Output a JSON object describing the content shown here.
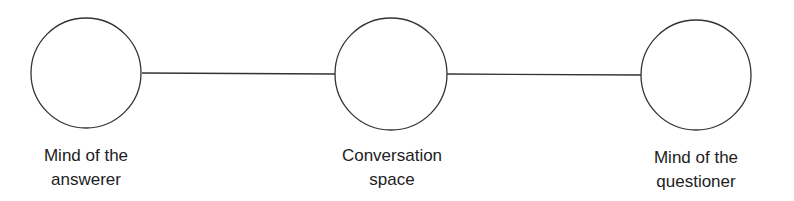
{
  "diagram": {
    "nodes": [
      {
        "id": "answerer",
        "label_line1": "Mind of the",
        "label_line2": "answerer",
        "cx": 86,
        "cy": 73,
        "r": 55
      },
      {
        "id": "conversation",
        "label_line1": "Conversation",
        "label_line2": "space",
        "cx": 391,
        "cy": 74,
        "r": 56
      },
      {
        "id": "questioner",
        "label_line1": "Mind of the",
        "label_line2": "questioner",
        "cx": 696,
        "cy": 75,
        "r": 55
      }
    ],
    "edges": [
      {
        "from": "answerer",
        "to": "conversation"
      },
      {
        "from": "conversation",
        "to": "questioner"
      }
    ],
    "stroke_color": "#333333"
  }
}
